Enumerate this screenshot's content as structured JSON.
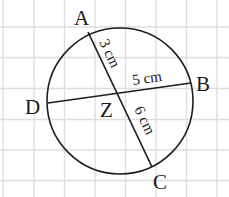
{
  "diagram": {
    "type": "circle-with-intersecting-chords",
    "background": "graph-paper",
    "colors": {
      "ink": "#1e1e1e",
      "grid": "#dedede",
      "paper": "#ffffff"
    },
    "points": {
      "A": "A",
      "B": "B",
      "C": "C",
      "D": "D",
      "Z": "Z"
    },
    "chords": [
      {
        "name": "AC",
        "from": "A",
        "to": "C",
        "through": "Z"
      },
      {
        "name": "DB",
        "from": "D",
        "to": "B",
        "through": "Z"
      }
    ],
    "measurements": {
      "AZ": "3 cm",
      "ZB": "5 cm",
      "ZC": "6 cm"
    }
  }
}
